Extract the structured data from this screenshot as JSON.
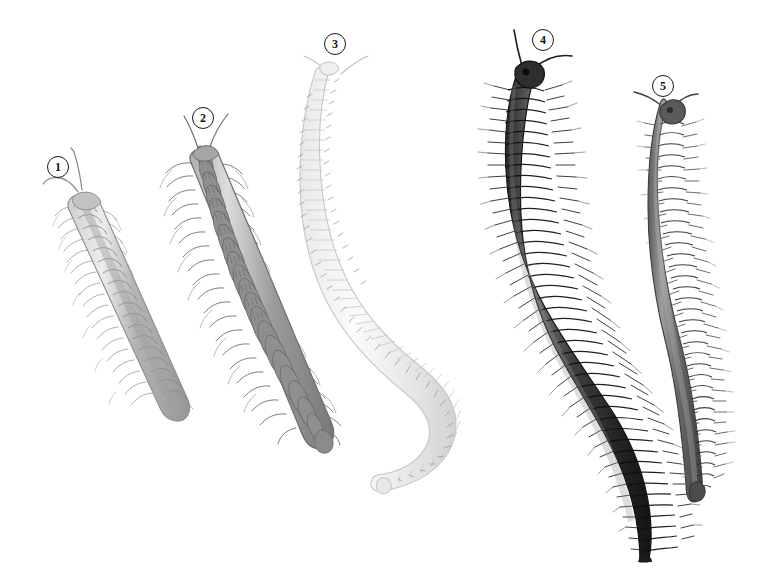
{
  "plate": {
    "title": "Millipede specimens comparative plate",
    "background_color": "#ffffff",
    "width": 757,
    "height": 568,
    "style": "scientific-illustration-grayscale"
  },
  "labels": [
    {
      "text": "1",
      "x": 47,
      "y": 156,
      "for": "specimen-1"
    },
    {
      "text": "2",
      "x": 192,
      "y": 107,
      "for": "specimen-2"
    },
    {
      "text": "3",
      "x": 324,
      "y": 33,
      "for": "specimen-3"
    },
    {
      "text": "4",
      "x": 532,
      "y": 29,
      "for": "specimen-4"
    },
    {
      "text": "5",
      "x": 652,
      "y": 75,
      "for": "specimen-5"
    }
  ],
  "specimens": [
    {
      "id": "specimen-1",
      "number": "1",
      "form": "flat-backed millipede",
      "tone": "light grey",
      "body_color": "#b9b9b9",
      "outline_color": "#8d8d8d",
      "segments": 19,
      "orientation": "diagonal, head upper-left, tail lower-right",
      "head": {
        "x": 80,
        "y": 196
      },
      "tail": {
        "x": 186,
        "y": 416
      },
      "antennae": "two, V-shaped, upper-left",
      "legs": "paired lateral, fine, bristly"
    },
    {
      "id": "specimen-2",
      "number": "2",
      "form": "broad keeled millipede",
      "tone": "medium grey",
      "body_color": "#9a9a9a",
      "outline_color": "#6e6e6e",
      "segments": 20,
      "orientation": "diagonal, head upper-left, tail lower-right",
      "head": {
        "x": 203,
        "y": 148
      },
      "tail": {
        "x": 327,
        "y": 448
      },
      "antennae": "two, short, upper",
      "legs": "paired lateral, long and hairy"
    },
    {
      "id": "specimen-3",
      "number": "3",
      "form": "pale snake millipede",
      "tone": "near white",
      "body_color": "#f2f2f2",
      "outline_color": "#c6c6c6",
      "segments": 46,
      "orientation": "S-curve, head top, tail lower-left",
      "head": {
        "x": 335,
        "y": 72
      },
      "tail": {
        "x": 382,
        "y": 492
      },
      "antennae": "two, wide V, top",
      "legs": "very fine, dotted"
    },
    {
      "id": "specimen-4",
      "number": "4",
      "form": "large dark julid millipede",
      "tone": "dark charcoal",
      "body_color": "#3a3a3a",
      "outline_color": "#1c1c1c",
      "segments": 62,
      "orientation": "long S-curve, head top, tail bottom edge",
      "head": {
        "x": 524,
        "y": 72
      },
      "tail": {
        "x": 647,
        "y": 562
      },
      "antennae": "two, long, splayed upward",
      "legs": "dense bristled fringe both sides"
    },
    {
      "id": "specimen-5",
      "number": "5",
      "form": "slender julid millipede",
      "tone": "medium-dark grey",
      "body_color": "#6a6a6a",
      "outline_color": "#3c3c3c",
      "segments": 46,
      "orientation": "gentle curve, head top, tail lower-right",
      "head": {
        "x": 666,
        "y": 110
      },
      "tail": {
        "x": 700,
        "y": 500
      },
      "antennae": "two, short, splayed",
      "legs": "fine fringe both sides"
    }
  ]
}
